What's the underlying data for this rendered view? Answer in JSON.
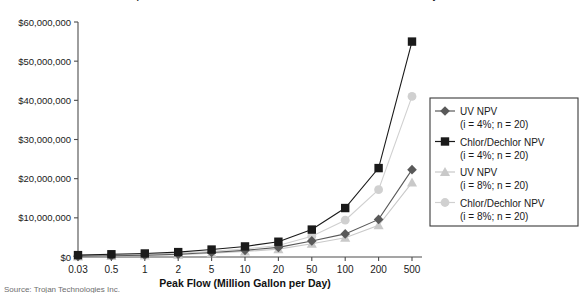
{
  "chart_data": {
    "type": "line",
    "title": "Comparison of Net Present Value of UV and Chlorination/Dechlorination Systems",
    "xlabel": "Peak Flow (Million Gallon per Day)",
    "ylabel": "",
    "categories": [
      "0.03",
      "0.5",
      "1",
      "2",
      "5",
      "10",
      "20",
      "50",
      "100",
      "200",
      "500"
    ],
    "ylim": [
      0,
      60000000
    ],
    "yticks": [
      0,
      10000000,
      20000000,
      30000000,
      40000000,
      50000000,
      60000000
    ],
    "ytick_labels": [
      "$0",
      "$10,000,000",
      "$20,000,000",
      "$30,000,000",
      "$40,000,000",
      "$50,000,000",
      "$60,000,000"
    ],
    "grid": false,
    "legend_position": "right",
    "series": [
      {
        "name": "UV NPV",
        "sublabel": "(i = 4%; n = 20)",
        "marker": "diamond",
        "color": "#595959",
        "values": [
          180000,
          330000,
          460000,
          690000,
          1150000,
          1700000,
          2450000,
          4100000,
          5900000,
          9600000,
          22300000
        ]
      },
      {
        "name": "Chlor/Dechlor NPV",
        "sublabel": "(i = 4%; n = 20)",
        "marker": "square",
        "color": "#1a1a1a",
        "values": [
          480000,
          700000,
          900000,
          1250000,
          1900000,
          2700000,
          3900000,
          7000000,
          12500000,
          22700000,
          55000000
        ]
      },
      {
        "name": "UV NPV",
        "sublabel": "(i = 8%; n = 20)",
        "marker": "triangle",
        "color": "#c9c9c9",
        "values": [
          150000,
          280000,
          390000,
          580000,
          950000,
          1400000,
          2000000,
          3400000,
          4900000,
          8100000,
          19000000
        ]
      },
      {
        "name": "Chlor/Dechlor NPV",
        "sublabel": "(i = 8%; n = 20)",
        "marker": "circle",
        "color": "#d0d0d0",
        "values": [
          360000,
          530000,
          680000,
          950000,
          1450000,
          2050000,
          2950000,
          5300000,
          9400000,
          17200000,
          41000000
        ]
      }
    ]
  },
  "footer": {
    "source_note": "Source: Trojan Technologies Inc."
  }
}
